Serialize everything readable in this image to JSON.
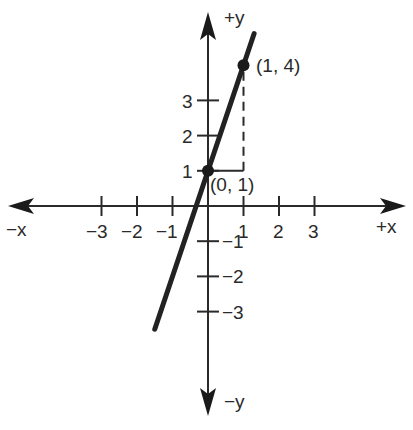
{
  "chart_data": {
    "type": "line",
    "title": "",
    "xlabel": "",
    "ylabel": "",
    "axis_labels": {
      "x_positive": "+x",
      "x_negative": "−x",
      "y_positive": "+y",
      "y_negative": "−y"
    },
    "x_ticks": [
      -3,
      -2,
      -1,
      1,
      2,
      3
    ],
    "x_tick_labels": [
      "−3",
      "−2",
      "−1",
      "1",
      "2",
      "3"
    ],
    "y_ticks": [
      -3,
      -2,
      -1,
      1,
      2,
      3
    ],
    "y_tick_labels": [
      "−3",
      "−2",
      "−1",
      "1",
      "2",
      "3"
    ],
    "xlim": [
      -5.5,
      5.5
    ],
    "ylim": [
      -5.8,
      5.5
    ],
    "grid": false,
    "series": [
      {
        "name": "y = 3x + 1",
        "equation": "y = 3x + 1",
        "x": [
          -1.5,
          1.3
        ],
        "y": [
          -3.5,
          4.9
        ],
        "color": "#222222"
      }
    ],
    "points": [
      {
        "x": 0,
        "y": 1,
        "label": "(0, 1)"
      },
      {
        "x": 1,
        "y": 4,
        "label": "(1, 4)"
      }
    ],
    "annotations": [
      {
        "type": "dashed-guide",
        "description": "Horizontal dashed segment from (0,1) to (1,1) and vertical dashed segment from (1,1) to (1,4) showing rise over run"
      }
    ]
  },
  "colors": {
    "ink": "#2a2a2a",
    "line": "#222222",
    "background": "#ffffff"
  }
}
